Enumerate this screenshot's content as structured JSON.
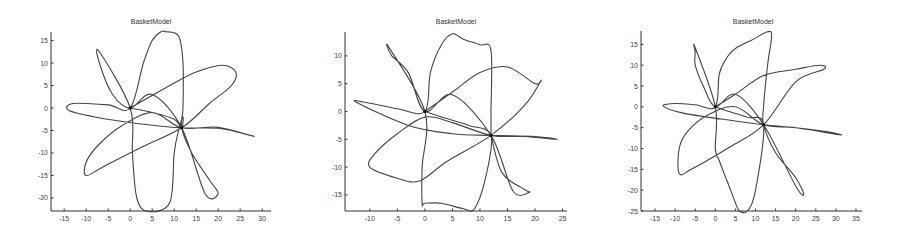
{
  "chart_data": [
    {
      "type": "line",
      "title": "BasketModel",
      "xlabel": "",
      "ylabel": "",
      "xlim": [
        -18,
        32
      ],
      "ylim": [
        -22.9,
        16.9
      ],
      "xticks": [
        -15,
        -10,
        -5,
        0,
        5,
        10,
        15,
        20,
        25,
        30
      ],
      "yticks": [
        15,
        10,
        5,
        0,
        -5,
        -10,
        -15,
        -20
      ],
      "grid": false,
      "markers": [
        {
          "x": 0,
          "y": 0
        },
        {
          "x": 11.7,
          "y": -4.4
        }
      ],
      "series": [
        {
          "name": "trajectory",
          "x": [
            0,
            9,
            15,
            21,
            24,
            23,
            18,
            11.7,
            2,
            -6,
            -10,
            -10,
            -7,
            -2,
            5,
            11.7,
            20,
            28,
            25,
            20,
            11.7,
            2,
            -8,
            -14,
            -13,
            -5,
            0,
            3,
            5,
            7,
            8,
            8,
            11,
            12,
            12,
            11.7,
            14,
            18,
            20,
            17,
            11.7,
            5,
            0,
            -4,
            -7,
            -7,
            0,
            0.5,
            1.5,
            4,
            9,
            10,
            11,
            12,
            11.7,
            10,
            5,
            0
          ],
          "y": [
            0,
            5,
            8,
            9.5,
            8,
            5,
            1,
            -4.4,
            -9,
            -13,
            -15,
            -12,
            -8,
            -4,
            -1,
            -4.4,
            -4.3,
            -6.3,
            -5.5,
            -4.5,
            -4.4,
            -3.5,
            -2,
            -0.5,
            1,
            0.7,
            0,
            10,
            15,
            17,
            17,
            17,
            16,
            10,
            0,
            -4.4,
            -10,
            -16,
            -19,
            -19,
            -4.4,
            3,
            0,
            3,
            10,
            12.5,
            0,
            -10,
            -20,
            -23,
            -21,
            -10,
            -5,
            -2,
            -4.4,
            -2.5,
            -1,
            0
          ]
        }
      ]
    },
    {
      "type": "line",
      "title": "BasketModel",
      "xlabel": "",
      "ylabel": "",
      "xlim": [
        -14.5,
        25.8
      ],
      "ylim": [
        -17.9,
        14.3
      ],
      "xticks": [
        -10,
        -5,
        0,
        5,
        10,
        15,
        20,
        25
      ],
      "yticks": [
        10,
        5,
        0,
        -5,
        -10,
        -15
      ],
      "grid": false,
      "markers": [
        {
          "x": 0,
          "y": 0
        },
        {
          "x": 12,
          "y": -4.3
        }
      ],
      "series": [
        {
          "name": "trajectory",
          "x": [
            0,
            5,
            10,
            15,
            20,
            21,
            18,
            12,
            4,
            -1,
            -5,
            -10,
            -9,
            -5,
            0,
            5,
            12,
            18,
            24,
            20,
            12,
            5,
            -3,
            -12.5,
            -10,
            -5,
            0,
            1,
            3,
            5,
            7,
            10,
            12,
            12,
            12,
            12,
            14,
            18,
            19,
            16,
            12,
            5,
            0,
            -3,
            -6,
            -6.5,
            0,
            -0.5,
            -0.5,
            0,
            3,
            7,
            9,
            11,
            12,
            8,
            3,
            0
          ],
          "y": [
            0,
            3.5,
            7,
            8,
            5,
            5.5,
            1,
            -4.3,
            -9,
            -12.5,
            -12,
            -10,
            -7.5,
            -4,
            -1,
            -2,
            -4.3,
            -4.5,
            -5,
            -4.5,
            -4.3,
            -4,
            -2.5,
            1.7,
            1.5,
            0.5,
            0,
            7,
            12,
            14,
            13,
            12,
            11,
            0,
            -4.3,
            -4.3,
            -11,
            -14,
            -14.5,
            -14.3,
            -4.3,
            3,
            0,
            7,
            10,
            11.5,
            0,
            -10,
            -16.5,
            -16.5,
            -16.5,
            -17.5,
            -17.5,
            -12,
            -4.3,
            -2.5,
            -1,
            0
          ]
        }
      ]
    },
    {
      "type": "line",
      "title": "BasketModel",
      "xlabel": "",
      "ylabel": "",
      "xlim": [
        -18.5,
        36.5
      ],
      "ylim": [
        -25,
        18.2
      ],
      "xticks": [
        -15,
        -10,
        -5,
        0,
        5,
        10,
        15,
        20,
        25,
        30,
        35
      ],
      "yticks": [
        15,
        10,
        5,
        0,
        -5,
        -10,
        -15,
        -20,
        -25
      ],
      "grid": false,
      "markers": [
        {
          "x": 0,
          "y": 0
        },
        {
          "x": 12,
          "y": -4.3
        }
      ],
      "series": [
        {
          "name": "trajectory",
          "x": [
            0,
            5,
            12,
            20,
            26,
            27,
            20,
            12,
            3,
            -6,
            -9,
            -9,
            -7,
            -2,
            5,
            12,
            20,
            31,
            28,
            20,
            12,
            2,
            -8,
            -13,
            -10,
            -5,
            0,
            1,
            3,
            5,
            9,
            13,
            14,
            13,
            12,
            12,
            15,
            20,
            22,
            20,
            12,
            5,
            0,
            -3,
            -5,
            -5,
            -5,
            0,
            0,
            1,
            3,
            5,
            6,
            8,
            10,
            12,
            8,
            3,
            0
          ],
          "y": [
            0,
            3,
            7.5,
            9,
            10,
            9,
            6,
            -4.3,
            -10,
            -15,
            -16,
            -10,
            -6,
            -2,
            0,
            -4.3,
            -5,
            -6.7,
            -6,
            -5,
            -4.3,
            -3,
            -1.5,
            0.2,
            0.8,
            0.5,
            0,
            8,
            12,
            14,
            16,
            18,
            17,
            10,
            0,
            -4.3,
            -11,
            -17,
            -21,
            -19,
            -4.3,
            3,
            0,
            5,
            10,
            13,
            14.2,
            0,
            -10,
            -13,
            -18,
            -23,
            -25,
            -25,
            -20,
            -4.3,
            -2.5,
            -1,
            0
          ]
        }
      ]
    }
  ]
}
